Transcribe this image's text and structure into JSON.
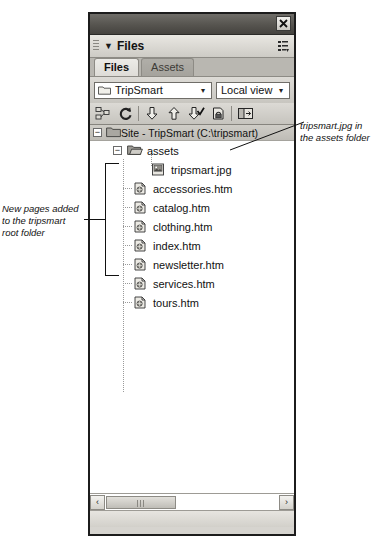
{
  "panel": {
    "title": "Files",
    "close_label": "✖",
    "collapse_triangle": "▼",
    "menu_icon": "panel-menu-icon",
    "tabs": [
      {
        "label": "Files",
        "active": true
      },
      {
        "label": "Assets",
        "active": false
      }
    ],
    "site_select": {
      "value": "TripSmart",
      "icon": "folder-icon",
      "arrow": "▾"
    },
    "view_select": {
      "value": "Local view",
      "arrow": "▾"
    },
    "toolbar": [
      {
        "name": "connect-to-remote-host-icon",
        "label": "Connect to remote host"
      },
      {
        "name": "refresh-icon",
        "label": "Refresh"
      },
      {
        "name": "get-files-icon",
        "label": "Get files"
      },
      {
        "name": "put-files-icon",
        "label": "Put files"
      },
      {
        "name": "check-out-icon",
        "label": "Check out"
      },
      {
        "name": "check-in-icon",
        "label": "Check in"
      },
      {
        "name": "expand-collapse-icon",
        "label": "Expand/Collapse"
      }
    ],
    "site_root": {
      "label": "Site - TripSmart (C:\\tripsmart)",
      "expander": "−",
      "icon": "folder-icon"
    },
    "tree": [
      {
        "label": "assets",
        "icon": "open-folder-icon",
        "expander": "−",
        "level": 1,
        "type": "folder"
      },
      {
        "label": "tripsmart.jpg",
        "icon": "image-file-icon",
        "level": 2,
        "type": "image"
      },
      {
        "label": "accessories.htm",
        "icon": "html-file-icon",
        "level": 1,
        "type": "page"
      },
      {
        "label": "catalog.htm",
        "icon": "html-file-icon",
        "level": 1,
        "type": "page"
      },
      {
        "label": "clothing.htm",
        "icon": "html-file-icon",
        "level": 1,
        "type": "page"
      },
      {
        "label": "index.htm",
        "icon": "html-file-icon",
        "level": 1,
        "type": "page"
      },
      {
        "label": "newsletter.htm",
        "icon": "html-file-icon",
        "level": 1,
        "type": "page"
      },
      {
        "label": "services.htm",
        "icon": "html-file-icon",
        "level": 1,
        "type": "page"
      },
      {
        "label": "tours.htm",
        "icon": "html-file-icon",
        "level": 1,
        "type": "page"
      }
    ],
    "scrollbar": {
      "left_arrow": "‹",
      "right_arrow": "›"
    }
  },
  "annotations": {
    "left": "New pages added to the tripsmart root folder",
    "right": "tripsmart.jpg in the assets folder"
  },
  "colors": {
    "panel_bg": "#d6d4cf",
    "titlebar": "#56544f",
    "list_bg": "#ffffff",
    "border": "#1c1c1c"
  }
}
